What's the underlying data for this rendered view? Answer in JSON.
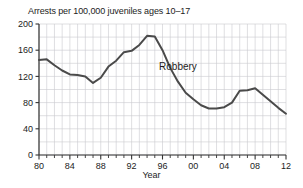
{
  "chart_data": {
    "type": "line",
    "title": "Arrests per 100,000 juveniles ages 10–17",
    "xlabel": "Year",
    "ylabel": "",
    "xlim": [
      1980,
      2012
    ],
    "ylim": [
      0,
      200
    ],
    "grid": true,
    "legend_position": "inline-annotation",
    "annotations": [
      {
        "text": "Robbery",
        "x": 1998,
        "y": 130
      }
    ],
    "ytick_labels": [
      "0",
      "40",
      "80",
      "120",
      "160",
      "200"
    ],
    "ytick_values": [
      0,
      40,
      80,
      120,
      160,
      200
    ],
    "xtick_labels": [
      "80",
      "84",
      "88",
      "92",
      "96",
      "00",
      "04",
      "08",
      "12"
    ],
    "xtick_values": [
      1980,
      1984,
      1988,
      1992,
      1996,
      2000,
      2004,
      2008,
      2012
    ],
    "series": [
      {
        "name": "Robbery",
        "color": "#4a4a4a",
        "x": [
          1980,
          1981,
          1982,
          1983,
          1984,
          1985,
          1986,
          1987,
          1988,
          1989,
          1990,
          1991,
          1992,
          1993,
          1994,
          1995,
          1996,
          1997,
          1998,
          1999,
          2000,
          2001,
          2002,
          2003,
          2004,
          2005,
          2006,
          2007,
          2008,
          2009,
          2010,
          2011,
          2012
        ],
        "values": [
          145,
          146,
          137,
          129,
          123,
          122,
          120,
          110,
          118,
          135,
          144,
          157,
          159,
          168,
          182,
          181,
          160,
          133,
          112,
          95,
          85,
          76,
          71,
          71,
          73,
          80,
          98,
          99,
          102,
          92,
          82,
          72,
          63
        ]
      }
    ]
  },
  "axis": {
    "tick_color": "#1c1c1c",
    "grid_color": "#c9c9cf",
    "line_color": "#333333"
  }
}
